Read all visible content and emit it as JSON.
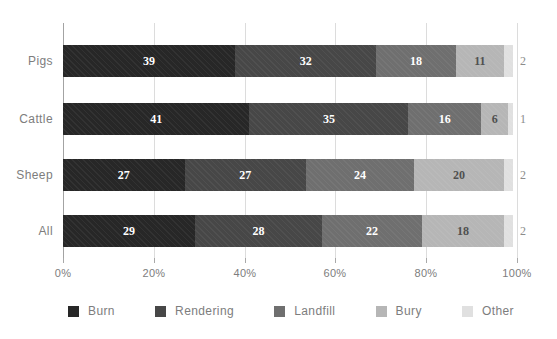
{
  "chart_data": {
    "type": "bar",
    "orientation": "horizontal-stacked",
    "title": "",
    "xlabel": "",
    "ylabel": "",
    "xlim": [
      0,
      100
    ],
    "grid": true,
    "legend_position": "bottom",
    "categories": [
      "Pigs",
      "Cattle",
      "Sheep",
      "All"
    ],
    "series": [
      {
        "name": "Burn",
        "color": "#272727",
        "label_style": "light",
        "values": [
          39,
          41,
          27,
          29
        ]
      },
      {
        "name": "Rendering",
        "color": "#474747",
        "label_style": "light",
        "values": [
          32,
          35,
          27,
          28
        ]
      },
      {
        "name": "Landfill",
        "color": "#6f6f6f",
        "label_style": "light",
        "values": [
          18,
          16,
          24,
          22
        ]
      },
      {
        "name": "Bury",
        "color": "#b6b6b6",
        "label_style": "dark",
        "values": [
          11,
          6,
          20,
          18
        ]
      },
      {
        "name": "Other",
        "color": "#e0e0e0",
        "label_style": "outside",
        "values": [
          2,
          1,
          2,
          2
        ]
      }
    ],
    "xticks": [
      "0%",
      "20%",
      "40%",
      "60%",
      "80%",
      "100%"
    ],
    "colors": {
      "background": "#ffffff",
      "gridline": "#dcdcdc",
      "axis_line": "#a3a3a3",
      "axis_text": "#7d7d7d",
      "value_label_light": "#ffffff",
      "value_label_dark": "#505050",
      "value_label_outside": "#8c8c8c"
    }
  }
}
